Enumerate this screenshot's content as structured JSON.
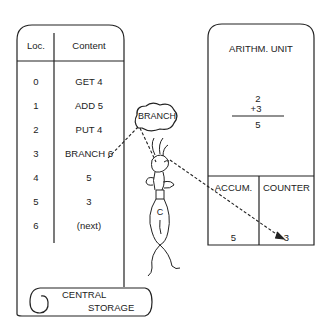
{
  "central_storage": {
    "label_line1": "CENTRAL",
    "label_line2": "STORAGE",
    "headers": {
      "loc": "Loc.",
      "content": "Content"
    },
    "rows": [
      {
        "loc": "0",
        "content": "GET 4"
      },
      {
        "loc": "1",
        "content": "ADD 5"
      },
      {
        "loc": "2",
        "content": "PUT 4"
      },
      {
        "loc": "3",
        "content": "BRANCH 6"
      },
      {
        "loc": "4",
        "content": "5"
      },
      {
        "loc": "5",
        "content": "3"
      },
      {
        "loc": "6",
        "content": "(next)"
      }
    ]
  },
  "arithmetic_unit": {
    "title": "ARITHM. UNIT",
    "sum": {
      "operand1": "2",
      "operand2": "+3",
      "result": "5"
    },
    "registers": [
      {
        "name": "ACCUM.",
        "value": "5"
      },
      {
        "name": "COUNTER",
        "value": "3"
      }
    ]
  },
  "control": {
    "thought_bubble": "BRANCH",
    "figure_label": "C"
  },
  "colors": {
    "ink": "#222222",
    "background": "#ffffff"
  }
}
